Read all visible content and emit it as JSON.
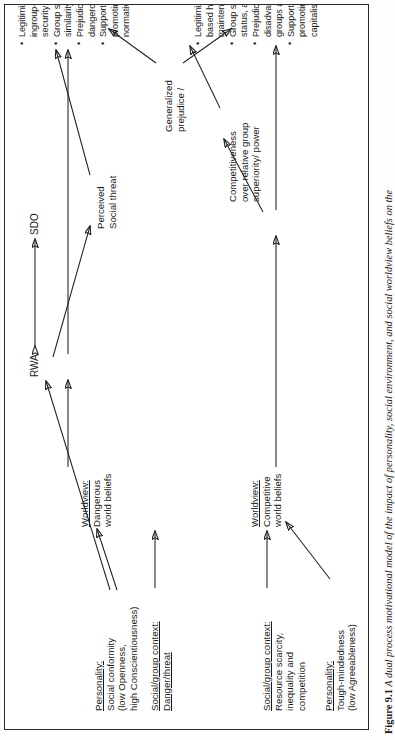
{
  "figure": {
    "number": "Figure 9.1",
    "caption": "A dual process motivational model of the impact of personality, social environment, and social worldview beliefs on the"
  },
  "diagram": {
    "title": "Dual process motivational model",
    "center_label": "Generalized prejudice /",
    "constructs": {
      "rwa": "RWA",
      "sdo": "SDO"
    },
    "mediators": {
      "perceived_threat": "Perceived\nSocial threat",
      "competitiveness": "Competitiveness\nover relative group\nsuperiority/ power"
    },
    "antecedents": [
      {
        "id": "personality-left",
        "header": "Personality:",
        "body": "Social conformity\n(low Openness,\nhigh Conscientiousness)"
      },
      {
        "id": "context-left",
        "header": "Social/group context:",
        "body": "Danger/threat"
      },
      {
        "id": "worldview-left",
        "header": "Worldview:",
        "body": "Dangerous\nworld beliefs"
      },
      {
        "id": "context-right",
        "header": "Social/group context:",
        "body": "Resource scarcity,\ninequality and\ncompetition"
      },
      {
        "id": "personality-right",
        "header": "Personality:",
        "body": "Tough-mindedness\n(low Agreeableness)"
      },
      {
        "id": "worldview-right",
        "header": "Worldview:",
        "body": "Competitive\nworld beliefs"
      }
    ],
    "outcomes_left": [
      "Legitimizing myths relating to ingroup-cohesion and collective security maintenance.",
      "Group stratification: moral and value-similarity based.",
      "Prejudice toward deviant and dangerous groups and peoples.",
      "Supportive of leaders and policies promoting, safety, law, order, and normative (often religious) tradition."
    ],
    "outcomes_right": [
      "Legitimizing myths relating to group-based hierarchy and status maintenance.",
      "Group stratification: competence, status, and power-based.",
      "Prejudice toward dissident, disadvantaged, and competing groups and peoples.",
      "Supportive of leaders and policies promoting deregulation, free-market capitalism, and anti-affirmative action."
    ]
  },
  "colors": {
    "ink": "#202020",
    "paper": "#ffffff",
    "frame": "#2a2a2a"
  }
}
